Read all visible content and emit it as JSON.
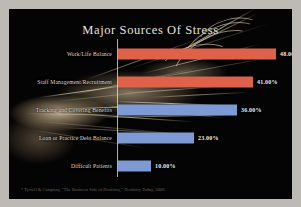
{
  "slide": {
    "title": "Major Sources Of Stress",
    "footnote": "* Tyrrell & Company, \"The Business Side of Dentistry,\" Dentistry Today, 2009.",
    "background_color": "#050404",
    "frame_color": "#bdbab5",
    "title_color": "#e8e4dc",
    "label_color": "#ddd9d1",
    "value_color": "#f0ece4",
    "axis_color": "#ebe8e2"
  },
  "chart_data": {
    "type": "bar",
    "orientation": "horizontal",
    "title": "Major Sources Of Stress",
    "xlabel": "",
    "ylabel": "",
    "xlim": [
      0,
      48
    ],
    "grid": false,
    "legend": "none",
    "value_format": "percent-2dp",
    "categories": [
      "Work/Life Balance",
      "Staff Management/Recruitment",
      "Tracking and Covering Benefits",
      "Loan or Practice Debt Balance",
      "Difficult Patients"
    ],
    "values": [
      48.0,
      41.0,
      36.0,
      23.0,
      10.0
    ],
    "value_labels": [
      "48.00%",
      "41.00%",
      "36.00%",
      "23.00%",
      "10.00%"
    ],
    "bar_colors": [
      "#e0614a",
      "#e0614a",
      "#7e9ad4",
      "#7e9ad4",
      "#7e9ad4"
    ],
    "series": [
      {
        "name": "Percent of respondents",
        "values": [
          48.0,
          41.0,
          36.0,
          23.0,
          10.0
        ]
      }
    ]
  },
  "bars": [
    {
      "label": "Work/Life Balance",
      "value_label": "48.00%",
      "value": 48,
      "color": "#e0614a"
    },
    {
      "label": "Staff Management/Recruitment",
      "value_label": "41.00%",
      "value": 41,
      "color": "#e0614a"
    },
    {
      "label": "Tracking and Covering Benefits",
      "value_label": "36.00%",
      "value": 36,
      "color": "#7e9ad4"
    },
    {
      "label": "Loan or Practice Debt Balance",
      "value_label": "23.00%",
      "value": 23,
      "color": "#7e9ad4"
    },
    {
      "label": "Difficult Patients",
      "value_label": "10.00%",
      "value": 10,
      "color": "#7e9ad4"
    }
  ]
}
